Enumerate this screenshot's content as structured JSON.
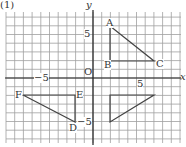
{
  "problem_label": "(1)",
  "axes": {
    "x_label": "x",
    "y_label": "y",
    "origin_label": "O",
    "tick_pos": "5",
    "tick_neg": "−5"
  },
  "grid": {
    "x_min": -10,
    "x_max": 10,
    "y_min": -7.5,
    "y_max": 7.5,
    "cell_px": 8.7
  },
  "triangles": [
    {
      "name": "ABC",
      "points": [
        {
          "label": "A",
          "x": 2,
          "y": 6
        },
        {
          "label": "B",
          "x": 2,
          "y": 2
        },
        {
          "label": "C",
          "x": 7,
          "y": 2
        }
      ]
    },
    {
      "name": "DEF",
      "points": [
        {
          "label": "D",
          "x": -2,
          "y": -5
        },
        {
          "label": "E",
          "x": -2,
          "y": -2
        },
        {
          "label": "F",
          "x": -8,
          "y": -2
        }
      ]
    },
    {
      "name": "unlabeled",
      "points": [
        {
          "label": "",
          "x": 2,
          "y": -2
        },
        {
          "label": "",
          "x": 7,
          "y": -2
        },
        {
          "label": "",
          "x": 2,
          "y": -5
        }
      ]
    }
  ],
  "colors": {
    "grid": "#9a9a9a",
    "axis": "#222222",
    "shape": "#444444"
  }
}
